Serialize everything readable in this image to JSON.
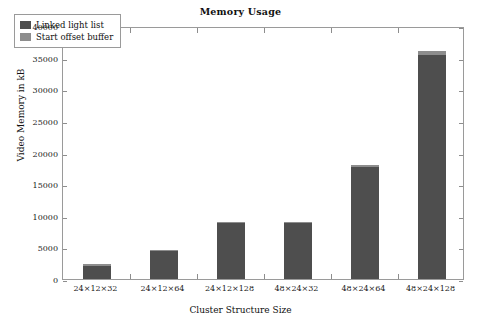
{
  "chart_data": {
    "type": "bar",
    "title": "Memory Usage",
    "xlabel": "Cluster Structure Size",
    "ylabel": "Video Memory in kB",
    "categories": [
      "24×12×32",
      "24×12×64",
      "24×12×128",
      "48×24×32",
      "48×24×64",
      "48×24×128"
    ],
    "series": [
      {
        "name": "Linked light list",
        "color": "#4e4e4e",
        "values": [
          2100,
          4400,
          8850,
          8850,
          17750,
          35400
        ]
      },
      {
        "name": "Start offset buffer",
        "color": "#8d8d8d",
        "values": [
          100,
          150,
          200,
          200,
          350,
          700
        ]
      }
    ],
    "stacked": true,
    "totals": [
      2200,
      4550,
      9050,
      9050,
      18100,
      36100
    ],
    "ylim": [
      0,
      40000
    ],
    "yticks": [
      0,
      5000,
      10000,
      15000,
      20000,
      25000,
      30000,
      35000,
      40000
    ],
    "ytick_labels": [
      "0",
      "5000",
      "10000",
      "15000",
      "20000",
      "25000",
      "30000",
      "35000",
      "40000"
    ],
    "grid": false,
    "legend_position": "upper-left",
    "frame": true
  },
  "legend": {
    "items": [
      {
        "label": "Linked light list",
        "color": "#4e4e4e"
      },
      {
        "label": "Start offset buffer",
        "color": "#8d8d8d"
      }
    ]
  }
}
